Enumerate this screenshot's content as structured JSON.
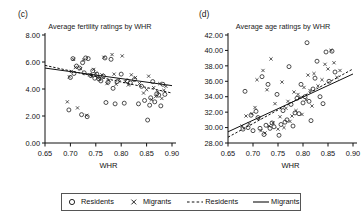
{
  "figure": {
    "panels": [
      {
        "tag": "(c)",
        "title": "Average fertility ratings by WHR"
      },
      {
        "tag": "(d)",
        "title": "Average age ratings by WHR"
      }
    ]
  },
  "legend": {
    "items": [
      {
        "marker": "circle-marker",
        "label": "Residents"
      },
      {
        "marker": "cross-marker",
        "label": "Migrants"
      },
      {
        "marker": "dashed-line-marker",
        "label": "Residents"
      },
      {
        "marker": "solid-line-marker",
        "label": "Migrants"
      }
    ]
  },
  "colors": {
    "axis": "#111111",
    "point": "#222222",
    "line": "#111111",
    "background": "#ffffff"
  },
  "chart_data": [
    {
      "type": "scatter",
      "panel": "(c)",
      "title": "Average fertility ratings by WHR",
      "xlabel": "WHR",
      "ylabel": "",
      "xlim": [
        0.65,
        0.9
      ],
      "ylim": [
        0.0,
        8.0
      ],
      "xticks": [
        0.65,
        0.7,
        0.75,
        0.8,
        0.85,
        0.9
      ],
      "xtick_labels": [
        "0.65",
        "0.70",
        "0.75",
        "0.80",
        "0.85",
        "0.90"
      ],
      "yticks": [
        0.0,
        2.0,
        4.0,
        6.0,
        8.0
      ],
      "ytick_labels": [
        "0.00",
        "2.00",
        "4.00",
        "6.00",
        "8.00"
      ],
      "grid": false,
      "legend_position": "below-figure",
      "series": [
        {
          "name": "Residents",
          "marker": "circle",
          "points": [
            [
              0.697,
              2.45
            ],
            [
              0.7,
              4.85
            ],
            [
              0.705,
              6.25
            ],
            [
              0.707,
              5.15
            ],
            [
              0.712,
              5.7
            ],
            [
              0.718,
              5.55
            ],
            [
              0.722,
              2.1
            ],
            [
              0.724,
              5.95
            ],
            [
              0.727,
              5.2
            ],
            [
              0.73,
              6.3
            ],
            [
              0.733,
              1.95
            ],
            [
              0.735,
              6.25
            ],
            [
              0.74,
              5.0
            ],
            [
              0.744,
              5.35
            ],
            [
              0.748,
              4.8
            ],
            [
              0.752,
              5.1
            ],
            [
              0.756,
              4.75
            ],
            [
              0.76,
              4.6
            ],
            [
              0.765,
              4.95
            ],
            [
              0.768,
              6.3
            ],
            [
              0.77,
              3.0
            ],
            [
              0.774,
              4.5
            ],
            [
              0.78,
              6.2
            ],
            [
              0.784,
              4.05
            ],
            [
              0.788,
              2.9
            ],
            [
              0.792,
              4.55
            ],
            [
              0.8,
              5.1
            ],
            [
              0.806,
              2.95
            ],
            [
              0.812,
              4.6
            ],
            [
              0.818,
              4.45
            ],
            [
              0.826,
              4.7
            ],
            [
              0.834,
              2.9
            ],
            [
              0.84,
              4.2
            ],
            [
              0.846,
              3.15
            ],
            [
              0.852,
              1.7
            ],
            [
              0.856,
              2.8
            ],
            [
              0.858,
              3.35
            ],
            [
              0.862,
              4.55
            ],
            [
              0.866,
              3.05
            ],
            [
              0.87,
              3.65
            ],
            [
              0.874,
              3.55
            ],
            [
              0.878,
              2.75
            ],
            [
              0.882,
              4.35
            ],
            [
              0.886,
              3.6
            ]
          ]
        },
        {
          "name": "Migrants",
          "marker": "cross",
          "points": [
            [
              0.694,
              3.05
            ],
            [
              0.698,
              4.9
            ],
            [
              0.702,
              5.3
            ],
            [
              0.706,
              6.2
            ],
            [
              0.71,
              5.6
            ],
            [
              0.714,
              2.6
            ],
            [
              0.72,
              5.5
            ],
            [
              0.726,
              6.15
            ],
            [
              0.732,
              2.05
            ],
            [
              0.738,
              5.05
            ],
            [
              0.742,
              4.95
            ],
            [
              0.746,
              5.45
            ],
            [
              0.75,
              5.15
            ],
            [
              0.754,
              4.85
            ],
            [
              0.758,
              4.7
            ],
            [
              0.762,
              5.05
            ],
            [
              0.766,
              6.35
            ],
            [
              0.772,
              4.4
            ],
            [
              0.776,
              4.65
            ],
            [
              0.782,
              6.55
            ],
            [
              0.786,
              5.1
            ],
            [
              0.79,
              4.35
            ],
            [
              0.796,
              4.7
            ],
            [
              0.802,
              6.45
            ],
            [
              0.808,
              4.55
            ],
            [
              0.814,
              4.3
            ],
            [
              0.82,
              5.05
            ],
            [
              0.828,
              4.85
            ],
            [
              0.836,
              4.4
            ],
            [
              0.844,
              3.7
            ],
            [
              0.85,
              3.95
            ],
            [
              0.854,
              4.95
            ],
            [
              0.86,
              3.2
            ],
            [
              0.864,
              4.1
            ],
            [
              0.868,
              3.45
            ],
            [
              0.872,
              3.8
            ],
            [
              0.876,
              4.4
            ],
            [
              0.88,
              3.3
            ],
            [
              0.884,
              3.9
            ],
            [
              0.888,
              4.2
            ]
          ]
        }
      ],
      "trendlines": [
        {
          "name": "Residents",
          "style": "dashed",
          "x": [
            0.65,
            0.9
          ],
          "y": [
            5.75,
            3.7
          ]
        },
        {
          "name": "Migrants",
          "style": "solid",
          "x": [
            0.65,
            0.9
          ],
          "y": [
            5.55,
            4.25
          ]
        }
      ]
    },
    {
      "type": "scatter",
      "panel": "(d)",
      "title": "Average age ratings by WHR",
      "xlabel": "WHR",
      "ylabel": "",
      "xlim": [
        0.65,
        0.9
      ],
      "ylim": [
        28.0,
        42.0
      ],
      "xticks": [
        0.65,
        0.7,
        0.75,
        0.8,
        0.85,
        0.9
      ],
      "xtick_labels": [
        "0.65",
        "0.70",
        "0.75",
        "0.80",
        "0.85",
        "0.90"
      ],
      "yticks": [
        28.0,
        30.0,
        32.0,
        34.0,
        36.0,
        38.0,
        40.0,
        42.0
      ],
      "ytick_labels": [
        "28.00",
        "30.00",
        "32.00",
        "34.00",
        "36.00",
        "38.00",
        "40.00",
        "42.00"
      ],
      "grid": false,
      "legend_position": "below-figure",
      "series": [
        {
          "name": "Residents",
          "marker": "circle",
          "points": [
            [
              0.68,
              29.8
            ],
            [
              0.684,
              34.7
            ],
            [
              0.69,
              30.0
            ],
            [
              0.696,
              31.6
            ],
            [
              0.7,
              29.6
            ],
            [
              0.706,
              32.1
            ],
            [
              0.71,
              31.3
            ],
            [
              0.714,
              29.9
            ],
            [
              0.718,
              36.6
            ],
            [
              0.722,
              29.1
            ],
            [
              0.726,
              30.3
            ],
            [
              0.73,
              35.6
            ],
            [
              0.734,
              29.9
            ],
            [
              0.738,
              30.6
            ],
            [
              0.742,
              30.1
            ],
            [
              0.748,
              34.3
            ],
            [
              0.752,
              29.0
            ],
            [
              0.756,
              30.4
            ],
            [
              0.76,
              32.2
            ],
            [
              0.764,
              30.7
            ],
            [
              0.768,
              31.0
            ],
            [
              0.772,
              37.9
            ],
            [
              0.776,
              33.0
            ],
            [
              0.78,
              30.2
            ],
            [
              0.784,
              31.9
            ],
            [
              0.788,
              33.8
            ],
            [
              0.792,
              31.8
            ],
            [
              0.796,
              35.6
            ],
            [
              0.8,
              33.2
            ],
            [
              0.804,
              34.0
            ],
            [
              0.808,
              41.0
            ],
            [
              0.812,
              33.4
            ],
            [
              0.816,
              30.9
            ],
            [
              0.82,
              35.0
            ],
            [
              0.824,
              36.4
            ],
            [
              0.828,
              38.6
            ],
            [
              0.834,
              34.0
            ],
            [
              0.84,
              33.1
            ],
            [
              0.846,
              39.8
            ],
            [
              0.852,
              36.0
            ],
            [
              0.858,
              39.9
            ],
            [
              0.864,
              37.2
            ]
          ]
        },
        {
          "name": "Migrants",
          "marker": "cross",
          "points": [
            [
              0.678,
              30.2
            ],
            [
              0.686,
              31.5
            ],
            [
              0.692,
              30.5
            ],
            [
              0.698,
              31.8
            ],
            [
              0.704,
              32.6
            ],
            [
              0.708,
              36.2
            ],
            [
              0.712,
              31.2
            ],
            [
              0.716,
              29.6
            ],
            [
              0.72,
              37.4
            ],
            [
              0.724,
              29.3
            ],
            [
              0.728,
              34.9
            ],
            [
              0.732,
              30.2
            ],
            [
              0.736,
              38.9
            ],
            [
              0.74,
              30.6
            ],
            [
              0.744,
              33.1
            ],
            [
              0.75,
              29.8
            ],
            [
              0.754,
              31.4
            ],
            [
              0.758,
              35.9
            ],
            [
              0.762,
              30.0
            ],
            [
              0.766,
              32.5
            ],
            [
              0.77,
              33.4
            ],
            [
              0.774,
              30.8
            ],
            [
              0.778,
              31.5
            ],
            [
              0.782,
              34.6
            ],
            [
              0.786,
              32.2
            ],
            [
              0.79,
              34.3
            ],
            [
              0.794,
              33.9
            ],
            [
              0.798,
              31.7
            ],
            [
              0.802,
              35.2
            ],
            [
              0.806,
              33.6
            ],
            [
              0.81,
              36.8
            ],
            [
              0.814,
              34.8
            ],
            [
              0.818,
              32.8
            ],
            [
              0.822,
              37.0
            ],
            [
              0.83,
              35.4
            ],
            [
              0.838,
              36.2
            ],
            [
              0.844,
              38.2
            ],
            [
              0.85,
              37.6
            ],
            [
              0.856,
              40.0
            ],
            [
              0.862,
              38.4
            ],
            [
              0.868,
              36.5
            ],
            [
              0.874,
              37.4
            ]
          ]
        }
      ],
      "trendlines": [
        {
          "name": "Residents",
          "style": "dashed",
          "x": [
            0.65,
            0.9
          ],
          "y": [
            28.75,
            37.6
          ]
        },
        {
          "name": "Migrants",
          "style": "solid",
          "x": [
            0.65,
            0.9
          ],
          "y": [
            29.45,
            36.95
          ]
        }
      ]
    }
  ]
}
